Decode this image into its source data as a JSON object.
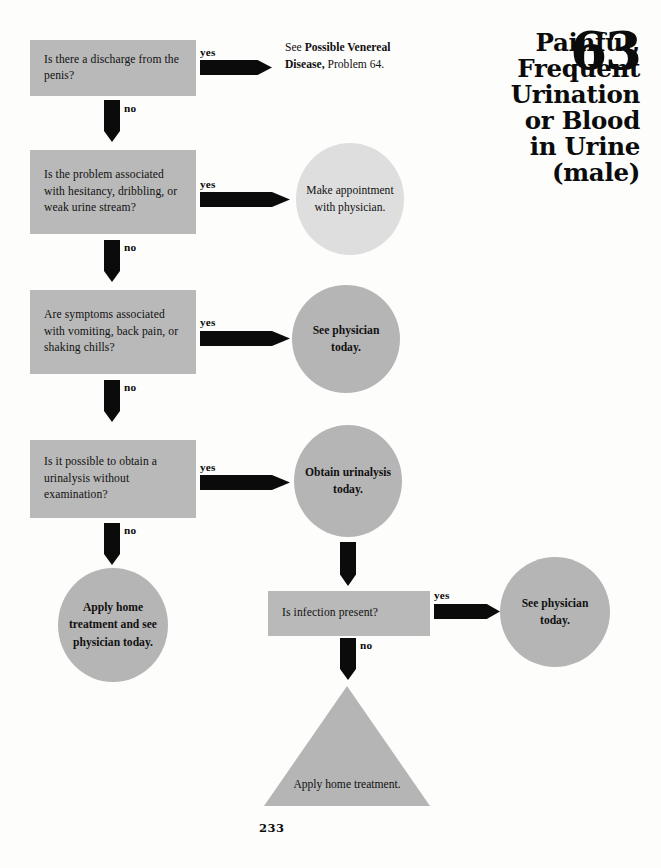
{
  "document": {
    "title_lines": [
      "Painful,",
      "Frequent",
      "Urination",
      "or Blood",
      "in Urine",
      "(male)"
    ],
    "problem_number": "63",
    "page_number": "233"
  },
  "flowchart": {
    "type": "decision-tree",
    "questions": [
      {
        "id": "q1",
        "text": "Is there a discharge from the penis?",
        "yes_label": "yes",
        "no_label": "no"
      },
      {
        "id": "q2",
        "text": "Is the problem associated with hesitancy, dribbling, or weak urine stream?",
        "yes_label": "yes",
        "no_label": "no"
      },
      {
        "id": "q3",
        "text": "Are symptoms associated with vomiting, back pain, or shaking chills?",
        "yes_label": "yes",
        "no_label": "no"
      },
      {
        "id": "q4",
        "text": "Is it possible to obtain a urinalysis without examination?",
        "yes_label": "yes",
        "no_label": "no"
      },
      {
        "id": "q5",
        "text": "Is infection present?",
        "yes_label": "yes",
        "no_label": "no"
      }
    ],
    "referral": {
      "prefix": "See ",
      "emphasis": "Possible Venereal Disease,",
      "suffix": " Problem 64."
    },
    "outcomes": [
      {
        "id": "o1",
        "text": "Make appointment with physician.",
        "shape": "circle",
        "emphasis": "normal"
      },
      {
        "id": "o2",
        "text": "See physician today.",
        "shape": "circle",
        "emphasis": "bold"
      },
      {
        "id": "o3",
        "text": "Obtain urinalysis today.",
        "shape": "circle",
        "emphasis": "bold"
      },
      {
        "id": "o4",
        "text": "Apply home treatment and see physician today.",
        "shape": "circle",
        "emphasis": "bold"
      },
      {
        "id": "o5",
        "text": "See physician today.",
        "shape": "circle",
        "emphasis": "bold"
      },
      {
        "id": "o6",
        "text": "Apply home treatment.",
        "shape": "triangle",
        "emphasis": "normal"
      }
    ]
  },
  "colors": {
    "box_gray": "#b9b9b9",
    "circle_gray": "#b5b5b5",
    "circle_light_gray": "#dedede",
    "arrow_black": "#0b0b0b",
    "page_background": "#fdfdfc"
  }
}
